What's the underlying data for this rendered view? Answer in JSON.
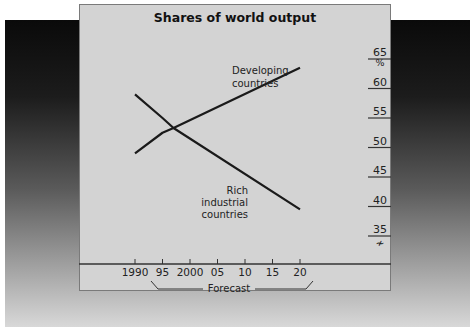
{
  "chart_data": {
    "type": "line",
    "title": "Shares of world output",
    "xlabel": "",
    "ylabel": "%",
    "x": [
      1990,
      1995,
      1997,
      2020
    ],
    "x_ticks": [
      "1990",
      "95",
      "2000",
      "05",
      "10",
      "15",
      "20"
    ],
    "x_tick_years": [
      1990,
      1995,
      2000,
      2005,
      2010,
      2015,
      2020
    ],
    "y_ticks": [
      "35",
      "40",
      "45",
      "50",
      "55",
      "60",
      "65"
    ],
    "ylim": [
      35,
      65
    ],
    "y_axis_position": "right",
    "y_axis_break": true,
    "grid": false,
    "series": [
      {
        "name": "Developing countries",
        "points": [
          [
            1990,
            49
          ],
          [
            1995,
            52.5
          ],
          [
            1997,
            53.3
          ],
          [
            2020,
            63.5
          ]
        ]
      },
      {
        "name": "Rich industrial countries",
        "points": [
          [
            1990,
            59
          ],
          [
            1995,
            55
          ],
          [
            1997,
            53.3
          ],
          [
            2020,
            39.5
          ]
        ]
      }
    ],
    "annotations": [
      {
        "text": "Developing countries",
        "near": "upper line"
      },
      {
        "text": "Rich industrial countries",
        "near": "lower line"
      },
      {
        "text": "Forecast",
        "span": [
          "1993",
          "2022"
        ]
      }
    ]
  },
  "labels": {
    "title": "Shares of world output",
    "unit": "%",
    "developing_1": "Developing",
    "developing_2": "countries",
    "rich_1": "Rich",
    "rich_2": "industrial",
    "rich_3": "countries",
    "forecast": "Forecast",
    "break": "≁"
  }
}
